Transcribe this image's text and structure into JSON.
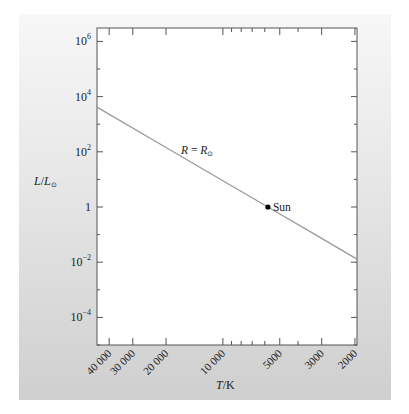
{
  "chart_data": {
    "type": "line",
    "title": "",
    "xlabel": "T/K",
    "ylabel": "L/L☉",
    "x_scale": "log",
    "y_scale": "log",
    "x_reversed": true,
    "xlim": [
      46400,
      1950
    ],
    "ylim": [
      1e-05,
      3000000
    ],
    "x_ticks": [
      {
        "value": 40000,
        "label": "40 000"
      },
      {
        "value": 30000,
        "label": "30 000"
      },
      {
        "value": 20000,
        "label": "20 000"
      },
      {
        "value": 10000,
        "label": "10 000"
      },
      {
        "value": 5000,
        "label": "5000"
      },
      {
        "value": 3000,
        "label": "3000"
      },
      {
        "value": 2000,
        "label": "2000"
      }
    ],
    "x_minor_ticks": [
      9000,
      8000,
      7000,
      6000,
      4000
    ],
    "y_ticks": [
      {
        "value": 1000000,
        "base": "10",
        "exp": "6"
      },
      {
        "value": 10000,
        "base": "10",
        "exp": "4"
      },
      {
        "value": 100,
        "base": "10",
        "exp": "2"
      },
      {
        "value": 1,
        "base": "1",
        "exp": ""
      },
      {
        "value": 0.01,
        "base": "10",
        "exp": "−2"
      },
      {
        "value": 0.0001,
        "base": "10",
        "exp": "−4"
      }
    ],
    "y_minor_ticks": [
      100000,
      1000,
      10,
      0.1,
      0.001,
      1e-05
    ],
    "series": [
      {
        "name": "R = R☉",
        "relation": "L ∝ T^4",
        "x": [
          46400,
          20000,
          10000,
          5778,
          3000,
          1950
        ],
        "y": [
          4160,
          143,
          8.97,
          1,
          0.0727,
          0.013
        ],
        "color": "#9a9a9a"
      }
    ],
    "points": [
      {
        "name": "Sun",
        "x": 5778,
        "y": 1,
        "color": "#000000"
      }
    ],
    "annotations": [
      {
        "text_main": "R",
        "text_eq": " = ",
        "text_sub": "R",
        "text_sub_symbol": "⊙",
        "x": 16500,
        "y": 100
      }
    ],
    "grid": false,
    "legend": null
  },
  "labels": {
    "ylabel_main": "L",
    "ylabel_slash": "/",
    "ylabel_den": "L",
    "ylabel_sym": "⊙",
    "xlabel_main": "T",
    "xlabel_unit": "/K",
    "line_label_R": "R",
    "line_label_eq": " = ",
    "line_label_R2": "R",
    "line_label_sym": "⊙",
    "sun_label": "Sun"
  },
  "colors": {
    "axis": "#555555",
    "line": "#9a9a9a",
    "text": "#222222",
    "point": "#000000"
  }
}
